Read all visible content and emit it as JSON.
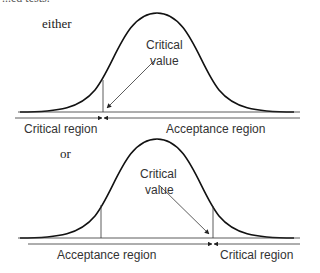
{
  "top_clipped_text": "...ed tests.",
  "panels": [
    {
      "tag": "either",
      "critical_value_label": [
        "Critical",
        "value"
      ],
      "left_region": "Critical region",
      "right_region": "Acceptance region"
    },
    {
      "tag": "or",
      "critical_value_label": [
        "Critical",
        "value"
      ],
      "left_region": "Acceptance region",
      "right_region": "Critical region"
    }
  ]
}
